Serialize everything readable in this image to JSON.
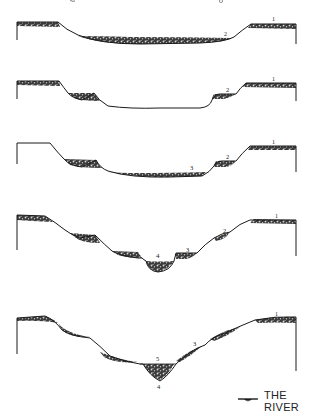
{
  "diagram": {
    "title_visible": "",
    "colors": {
      "line": "#1a1a1a",
      "fill_dark": "#2a2a2a",
      "fill_speckle": "#bdbdbd",
      "background": "#ffffff"
    },
    "profiles": [
      {
        "stage": 1,
        "labels": [
          {
            "text": "1",
            "position": "upper-right-floodplain"
          },
          {
            "text": "2",
            "position": "valley-floor-right"
          }
        ]
      },
      {
        "stage": 2,
        "labels": [
          {
            "text": "1",
            "position": "upper-right-floodplain"
          },
          {
            "text": "2",
            "position": "terrace-right"
          }
        ]
      },
      {
        "stage": 3,
        "labels": [
          {
            "text": "1",
            "position": "upper-right-floodplain"
          },
          {
            "text": "2",
            "position": "terrace-right"
          },
          {
            "text": "3",
            "position": "valley-floor"
          }
        ]
      },
      {
        "stage": 4,
        "labels": [
          {
            "text": "1",
            "position": "upper-right-floodplain"
          },
          {
            "text": "2",
            "position": "terrace-right"
          },
          {
            "text": "3",
            "position": "terrace-right-lower"
          },
          {
            "text": "4",
            "position": "channel"
          }
        ]
      },
      {
        "stage": 5,
        "labels": [
          {
            "text": "1",
            "position": "upper-right-floodplain"
          },
          {
            "text": "2",
            "position": "terrace-right"
          },
          {
            "text": "3",
            "position": "terrace-right-lower"
          },
          {
            "text": "5",
            "position": "above-channel"
          },
          {
            "text": "4",
            "position": "below-channel"
          }
        ]
      }
    ]
  },
  "legend": {
    "icon": "river-symbol-icon",
    "label": "THE RIVER"
  }
}
